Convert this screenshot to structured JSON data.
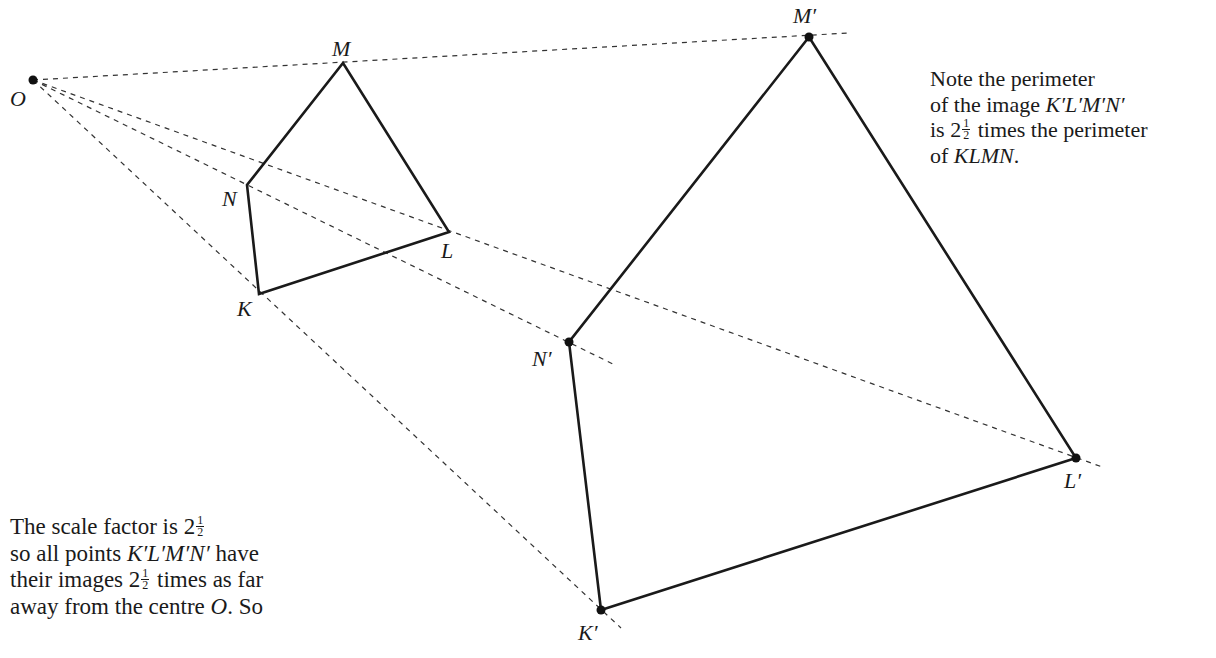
{
  "diagram": {
    "type": "enlargement",
    "centre": {
      "label": "O",
      "x": 33,
      "y": 80
    },
    "object": [
      {
        "label": "K",
        "x": 259,
        "y": 294,
        "lx": 237,
        "ly": 316
      },
      {
        "label": "L",
        "x": 449,
        "y": 232,
        "lx": 441,
        "ly": 258
      },
      {
        "label": "M",
        "x": 343,
        "y": 63,
        "lx": 332,
        "ly": 56
      },
      {
        "label": "N",
        "x": 247,
        "y": 185,
        "lx": 222,
        "ly": 206
      }
    ],
    "image": [
      {
        "label": "K′",
        "x": 601,
        "y": 610,
        "lx": 578,
        "ly": 640
      },
      {
        "label": "L′",
        "x": 1076,
        "y": 458,
        "lx": 1064,
        "ly": 488
      },
      {
        "label": "M′",
        "x": 809,
        "y": 37,
        "lx": 793,
        "ly": 23
      },
      {
        "label": "N′",
        "x": 569,
        "y": 342,
        "lx": 532,
        "ly": 366
      }
    ],
    "rays_end": [
      {
        "to": "M′",
        "x": 848,
        "y": 33
      },
      {
        "to": "N′",
        "x": 615,
        "y": 365
      },
      {
        "to": "L′",
        "x": 1105,
        "y": 468
      },
      {
        "to": "K′",
        "x": 621,
        "y": 628
      }
    ],
    "colors": {
      "stroke": "#1a1a1a",
      "dash": "#333333"
    }
  },
  "note_right": {
    "line1": "Note the perimeter",
    "line2_prefix": "of the image ",
    "line2_italic": "K′L′M′N′",
    "line3_prefix": "is 2",
    "frac_num": "1",
    "frac_den": "2",
    "line3_suffix": " times the perimeter",
    "line4_prefix": "of ",
    "line4_italic": "KLMN",
    "line4_suffix": "."
  },
  "note_left": {
    "line1_prefix": "The scale factor is 2",
    "frac_num": "1",
    "frac_den": "2",
    "line2_prefix": "so all points ",
    "line2_italic": "K′L′M′N′",
    "line2_suffix": " have",
    "line3_prefix": "their images 2",
    "line3_suffix": " times as far",
    "line4_prefix": "away from the centre ",
    "line4_italic": "O",
    "line4_suffix": ". So"
  }
}
